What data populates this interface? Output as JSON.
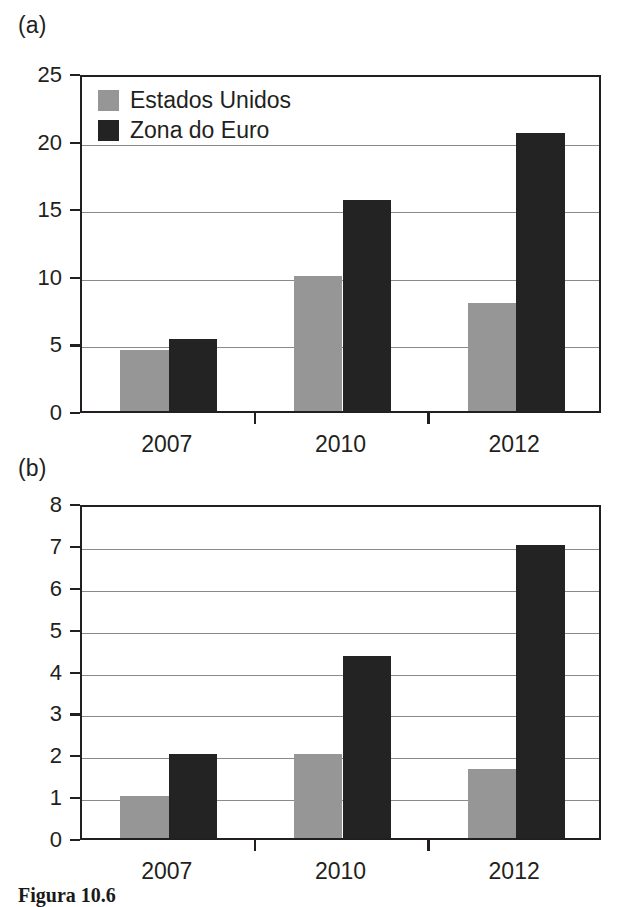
{
  "figure": {
    "caption": "Figura 10.6",
    "panel_a_label": "(a)",
    "panel_b_label": "(b)"
  },
  "legend": {
    "position": "top-left",
    "items": [
      {
        "label": "Estados Unidos",
        "color": "#969696",
        "swatch": "gray-square-icon"
      },
      {
        "label": "Zona do Euro",
        "color": "#232323",
        "swatch": "black-square-icon"
      }
    ]
  },
  "colors": {
    "estados_unidos": "#969696",
    "zona_do_euro": "#232323",
    "axis": "#231f20",
    "grid": "#8a8a8a",
    "background": "#ffffff"
  },
  "chart_data": [
    {
      "type": "bar",
      "panel": "(a)",
      "title": "",
      "xlabel": "",
      "ylabel": "",
      "categories": [
        "2007",
        "2010",
        "2012"
      ],
      "series": [
        {
          "name": "Estados Unidos",
          "color": "#969696",
          "values": [
            4.5,
            10.0,
            8.0
          ]
        },
        {
          "name": "Zona do Euro",
          "color": "#232323",
          "values": [
            5.3,
            15.6,
            20.6
          ]
        }
      ],
      "ylim": [
        0,
        25
      ],
      "yticks": [
        0,
        5,
        10,
        15,
        20,
        25
      ],
      "ytick_labels": [
        "0",
        "5",
        "10",
        "15",
        "20",
        "25"
      ],
      "grid": true,
      "legend": "top-left"
    },
    {
      "type": "bar",
      "panel": "(b)",
      "title": "",
      "xlabel": "",
      "ylabel": "",
      "categories": [
        "2007",
        "2010",
        "2012"
      ],
      "series": [
        {
          "name": "Estados Unidos",
          "color": "#969696",
          "values": [
            1.0,
            2.0,
            1.65
          ]
        },
        {
          "name": "Zona do Euro",
          "color": "#232323",
          "values": [
            2.0,
            4.35,
            7.0
          ]
        }
      ],
      "ylim": [
        0,
        8
      ],
      "yticks": [
        0,
        1,
        2,
        3,
        4,
        5,
        6,
        7,
        8
      ],
      "ytick_labels": [
        "0",
        "1",
        "2",
        "3",
        "4",
        "5",
        "6",
        "7",
        "8"
      ],
      "grid": true,
      "legend": "none"
    }
  ]
}
